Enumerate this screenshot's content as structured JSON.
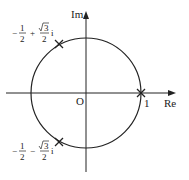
{
  "diagram": {
    "type": "complex-plane-unit-circle",
    "axes": {
      "x_label": "Re",
      "y_label": "Im",
      "origin_label": "O"
    },
    "circle": {
      "center": [
        0,
        0
      ],
      "radius": 1
    },
    "points": [
      {
        "label": "1",
        "re": 1,
        "im": 0
      },
      {
        "label_real": "−",
        "label_frac": "1",
        "label_den": "2",
        "label_op": "+",
        "label_sqrt": "3",
        "label_den2": "2",
        "label_i": "i",
        "re": -0.5,
        "im": 0.866
      },
      {
        "label_real": "−",
        "label_frac": "1",
        "label_den": "2",
        "label_op": "−",
        "label_sqrt": "3",
        "label_den2": "2",
        "label_i": "i",
        "re": -0.5,
        "im": -0.866
      }
    ],
    "colors": {
      "stroke": "#222222",
      "background": "#ffffff"
    }
  }
}
